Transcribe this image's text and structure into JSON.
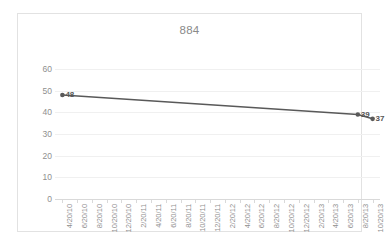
{
  "chart_data": {
    "type": "line",
    "title": "884",
    "xlabel": "",
    "ylabel": "",
    "ylim": [
      0,
      60
    ],
    "ytick_values": [
      60,
      50,
      40,
      30,
      20,
      10,
      0
    ],
    "ytick_labels": [
      "60",
      "50",
      "40",
      "30",
      "20",
      "10",
      "0"
    ],
    "grid": true,
    "legend": "none",
    "categories": [
      "4/20/10",
      "6/20/10",
      "8/20/10",
      "10/20/10",
      "12/20/10",
      "2/20/11",
      "4/20/11",
      "6/20/11",
      "8/20/11",
      "10/20/11",
      "12/20/11",
      "2/20/12",
      "4/20/12",
      "6/20/12",
      "8/20/12",
      "10/20/12",
      "12/20/12",
      "2/20/13",
      "4/20/13",
      "6/20/13",
      "8/20/13",
      "10/20/13"
    ],
    "series": [
      {
        "name": "884",
        "points": [
          {
            "x": "4/20/10",
            "x_index": 0,
            "y": 48,
            "label": "48"
          },
          {
            "x": "8/20/13",
            "x_index": 20,
            "y": 39,
            "label": "39"
          },
          {
            "x": "10/20/13",
            "x_index": 21,
            "y": 37,
            "label": "37"
          }
        ]
      }
    ],
    "colors": {
      "line": "#595959",
      "marker": "#595959",
      "gridline": "#f0f0f0",
      "axis": "#d9d9d9",
      "tick_text": "#8f8f8f",
      "title_text": "#8a8a8a",
      "data_label_text": "#555555",
      "border": "#e2e2e2",
      "background": "#ffffff"
    }
  }
}
